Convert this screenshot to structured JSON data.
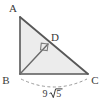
{
  "figure": {
    "type": "geometry-diagram",
    "background_color": "#ffffff",
    "fill_color": "#ececec",
    "stroke_color": "#4d4d4d",
    "label_color": "#3a3a3a",
    "dash_color": "#9a9a9a"
  },
  "vertices": [
    {
      "id": "A",
      "label": "A",
      "x": 20,
      "y": 17,
      "label_x": 13,
      "label_y": 12
    },
    {
      "id": "B",
      "label": "B",
      "x": 20,
      "y": 74,
      "label_x": 6,
      "label_y": 84
    },
    {
      "id": "C",
      "label": "C",
      "x": 88,
      "y": 74,
      "label_x": 93,
      "label_y": 84
    },
    {
      "id": "D",
      "label": "D",
      "x": 48,
      "y": 44,
      "label_x": 53,
      "label_y": 41
    }
  ],
  "segments": [
    {
      "id": "AB",
      "from": "A",
      "to": "B",
      "style": "solid"
    },
    {
      "id": "AC",
      "from": "A",
      "to": "C",
      "style": "solid"
    },
    {
      "id": "BC",
      "from": "B",
      "to": "C",
      "style": "solid"
    },
    {
      "id": "BD",
      "from": "B",
      "to": "D",
      "style": "solid"
    }
  ],
  "right_angle_marks": [
    {
      "id": "angle-at-D",
      "at": "D",
      "between": [
        "BD",
        "AC"
      ]
    }
  ],
  "measurements": [
    {
      "id": "BC-length",
      "applies_to": "BC",
      "coefficient": "9",
      "radicand": "5",
      "text": "9√5",
      "label_x": 53,
      "label_y": 96,
      "guide": "dashed-arc"
    }
  ]
}
